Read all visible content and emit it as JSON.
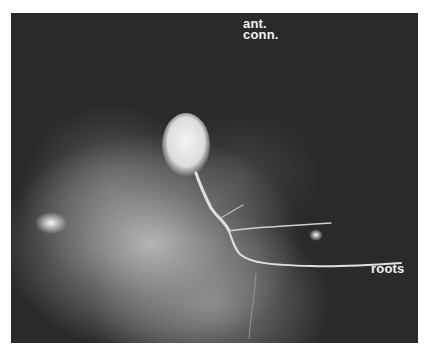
{
  "figure": {
    "labels": {
      "ant_conn_line1": "ant.",
      "ant_conn_line2": "conn.",
      "roots": "roots"
    },
    "colors": {
      "background": "#2a2a2a",
      "ganglion_glow": "#b8b8b8",
      "cell_body": "#eeeeee",
      "border": "#ffffff"
    }
  }
}
